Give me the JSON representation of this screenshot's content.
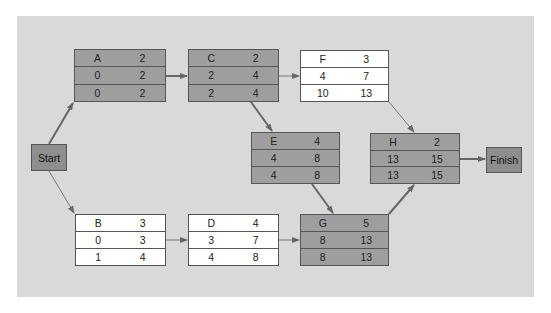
{
  "diagram": {
    "type": "activity-on-node network (critical path)",
    "colors": {
      "background_panel": "#d9d9d9",
      "critical_node_fill": "#9e9e9e",
      "noncritical_node_fill": "#ffffff",
      "terminal_fill": "#8e8e8e",
      "edge": "#666666"
    },
    "start": {
      "label": "Start"
    },
    "finish": {
      "label": "Finish"
    },
    "nodes": {
      "A": {
        "name": "A",
        "duration": "2",
        "es": "0",
        "ef": "2",
        "ls": "0",
        "lf": "2",
        "critical": true
      },
      "B": {
        "name": "B",
        "duration": "3",
        "es": "0",
        "ef": "3",
        "ls": "1",
        "lf": "4",
        "critical": false
      },
      "C": {
        "name": "C",
        "duration": "2",
        "es": "2",
        "ef": "4",
        "ls": "2",
        "lf": "4",
        "critical": true
      },
      "D": {
        "name": "D",
        "duration": "4",
        "es": "3",
        "ef": "7",
        "ls": "4",
        "lf": "8",
        "critical": false
      },
      "E": {
        "name": "E",
        "duration": "4",
        "es": "4",
        "ef": "8",
        "ls": "4",
        "lf": "8",
        "critical": true
      },
      "F": {
        "name": "F",
        "duration": "3",
        "es": "4",
        "ef": "7",
        "ls": "10",
        "lf": "13",
        "critical": false
      },
      "G": {
        "name": "G",
        "duration": "5",
        "es": "8",
        "ef": "13",
        "ls": "8",
        "lf": "13",
        "critical": true
      },
      "H": {
        "name": "H",
        "duration": "2",
        "es": "13",
        "ef": "15",
        "ls": "13",
        "lf": "15",
        "critical": true
      }
    },
    "edges": [
      {
        "from": "Start",
        "to": "A",
        "critical": true
      },
      {
        "from": "Start",
        "to": "B",
        "critical": false
      },
      {
        "from": "A",
        "to": "C",
        "critical": true
      },
      {
        "from": "C",
        "to": "F",
        "critical": false
      },
      {
        "from": "C",
        "to": "E",
        "critical": true
      },
      {
        "from": "B",
        "to": "D",
        "critical": false
      },
      {
        "from": "D",
        "to": "G",
        "critical": false
      },
      {
        "from": "E",
        "to": "G",
        "critical": true
      },
      {
        "from": "F",
        "to": "H",
        "critical": false
      },
      {
        "from": "G",
        "to": "H",
        "critical": true
      },
      {
        "from": "H",
        "to": "Finish",
        "critical": true
      }
    ]
  }
}
